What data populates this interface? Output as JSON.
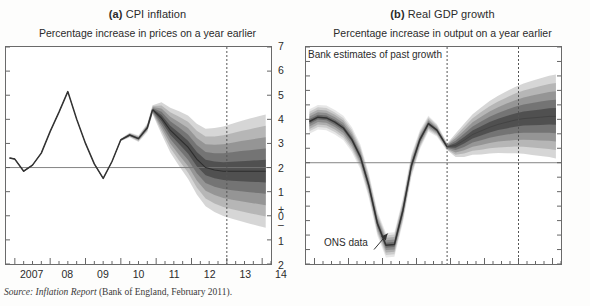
{
  "figure": {
    "source_prefix": "Source:",
    "source_italic": "Inflation Report",
    "source_rest": "(Bank of England, February 2011)."
  },
  "panels": [
    {
      "key": "a",
      "letter": "(a)",
      "title": "CPI inflation",
      "axis_caption": "Percentage increase in prices on a year earlier",
      "y_labels_right": [
        "7",
        "6",
        "5",
        "4",
        "3",
        "2",
        "1",
        "+",
        "0",
        "–",
        "1",
        "2"
      ],
      "x_labels": [
        "2007",
        "08",
        "09",
        "10",
        "11",
        "12",
        "13",
        "14"
      ],
      "ylim": [
        -2,
        7
      ],
      "xlim": [
        2006.75,
        2014.25
      ],
      "zero_line": 2
    },
    {
      "key": "b",
      "letter": "(b)",
      "title": "Real GDP growth",
      "axis_caption": "Percentage increase in output on a year earlier",
      "y_labels_right": [
        "8",
        "7",
        "6",
        "5",
        "4",
        "3",
        "2",
        "1",
        "+",
        "0",
        "–",
        "1",
        "2",
        "3",
        "4",
        "5",
        "6",
        "7"
      ],
      "x_labels": [
        "2007",
        "08",
        "09",
        "10",
        "11",
        "12",
        "13",
        "14"
      ],
      "ylim": [
        -7,
        8
      ],
      "xlim": [
        2006.75,
        2014.25
      ],
      "zero_line": 0,
      "annotations": {
        "past": "Bank estimates of past growth",
        "projection": "Projection",
        "ons": "ONS data"
      }
    }
  ],
  "chart_data": [
    {
      "type": "area",
      "id": "cpi-inflation-fan",
      "title": "(a) CPI inflation",
      "xlabel": "",
      "ylabel": "Percentage increase in prices on a year earlier",
      "ylim": [
        -2,
        7
      ],
      "xlim": [
        2006.75,
        2014.25
      ],
      "yticks": [
        -2,
        -1,
        0,
        1,
        2,
        3,
        4,
        5,
        6,
        7
      ],
      "xticks": [
        2007,
        2008,
        2009,
        2010,
        2011,
        2012,
        2013,
        2014
      ],
      "grid": false,
      "legend": "none",
      "zero_reference_line": 2,
      "forecast_start": 2010.9,
      "vertical_dashed_line": 2013.0,
      "series": [
        {
          "name": "CPI inflation (outturn)",
          "type": "line",
          "color": "#333333",
          "x": [
            2006.85,
            2007.0,
            2007.25,
            2007.5,
            2007.75,
            2008.0,
            2008.25,
            2008.5,
            2008.75,
            2009.0,
            2009.25,
            2009.5,
            2009.75,
            2010.0,
            2010.25,
            2010.5,
            2010.75,
            2010.9
          ],
          "values": [
            2.4,
            2.35,
            1.85,
            2.1,
            2.6,
            3.5,
            4.3,
            5.15,
            4.0,
            3.0,
            2.15,
            1.55,
            2.25,
            3.15,
            3.35,
            3.2,
            3.65,
            4.4
          ]
        },
        {
          "name": "Fan central (mode)",
          "type": "line",
          "x": [
            2010.9,
            2011.15,
            2011.4,
            2011.65,
            2011.9,
            2012.15,
            2012.4,
            2012.65,
            2012.9,
            2013.15,
            2013.4,
            2013.65,
            2013.9,
            2014.1
          ],
          "values": [
            4.4,
            4.05,
            3.55,
            3.2,
            2.85,
            2.35,
            2.0,
            1.9,
            1.85,
            1.85,
            1.85,
            1.85,
            1.85,
            1.85
          ]
        }
      ],
      "fan_bands": [
        {
          "probability": 10,
          "shade": "#4a4a4a",
          "lower_offset": -0.18,
          "upper_offset": 0.18
        },
        {
          "probability": 30,
          "shade": "#6e6e6e",
          "lower_offset": -0.55,
          "upper_offset": 0.55
        },
        {
          "probability": 50,
          "shade": "#8f8f8f",
          "lower_offset": -0.95,
          "upper_offset": 0.95
        },
        {
          "probability": 70,
          "shade": "#b0b0b0",
          "lower_offset": -1.4,
          "upper_offset": 1.4
        },
        {
          "probability": 90,
          "shade": "#cfcfcf",
          "lower_offset": -1.9,
          "upper_offset": 1.9
        }
      ]
    },
    {
      "type": "area",
      "id": "real-gdp-growth-fan",
      "title": "(b) Real GDP growth",
      "xlabel": "",
      "ylabel": "Percentage increase in output on a year earlier",
      "ylim": [
        -7,
        8
      ],
      "xlim": [
        2006.75,
        2014.25
      ],
      "yticks": [
        -7,
        -6,
        -5,
        -4,
        -3,
        -2,
        -1,
        0,
        1,
        2,
        3,
        4,
        5,
        6,
        7,
        8
      ],
      "xticks": [
        2007,
        2008,
        2009,
        2010,
        2011,
        2012,
        2013,
        2014
      ],
      "grid": false,
      "legend": "none",
      "zero_reference_line": 0,
      "forecast_start": 2010.9,
      "vertical_dashed_lines": [
        2010.9,
        2013.0
      ],
      "series": [
        {
          "name": "Bank estimates of past growth (ONS data)",
          "type": "line",
          "color": "#333333",
          "x": [
            2006.85,
            2007.1,
            2007.35,
            2007.6,
            2007.85,
            2008.1,
            2008.35,
            2008.6,
            2008.85,
            2009.1,
            2009.35,
            2009.6,
            2009.85,
            2010.1,
            2010.35,
            2010.6,
            2010.9
          ],
          "values": [
            2.85,
            3.15,
            3.1,
            2.8,
            2.4,
            1.6,
            0.4,
            -1.6,
            -4.2,
            -5.7,
            -5.65,
            -3.3,
            -0.2,
            1.6,
            2.7,
            2.25,
            1.1
          ]
        },
        {
          "name": "Projection central (mode)",
          "type": "line",
          "x": [
            2010.9,
            2011.15,
            2011.4,
            2011.65,
            2011.9,
            2012.15,
            2012.4,
            2012.65,
            2012.9,
            2013.15,
            2013.4,
            2013.65,
            2013.9,
            2014.1
          ],
          "values": [
            1.1,
            1.2,
            1.55,
            1.95,
            2.2,
            2.45,
            2.65,
            2.8,
            2.95,
            3.05,
            3.1,
            3.15,
            3.2,
            3.2
          ]
        }
      ],
      "fan_bands": [
        {
          "probability": 10,
          "shade": "#4a4a4a"
        },
        {
          "probability": 30,
          "shade": "#6e6e6e"
        },
        {
          "probability": 50,
          "shade": "#8f8f8f"
        },
        {
          "probability": 70,
          "shade": "#b0b0b0"
        },
        {
          "probability": 90,
          "shade": "#cfcfcf"
        }
      ]
    }
  ]
}
